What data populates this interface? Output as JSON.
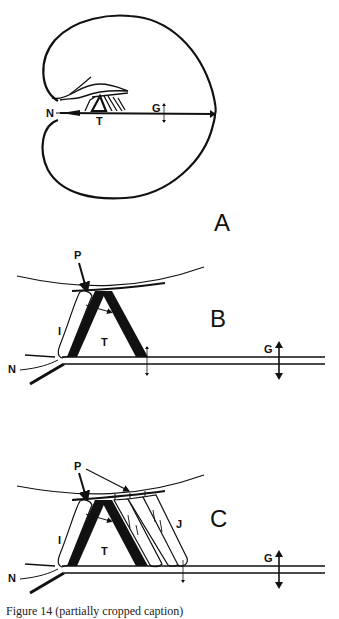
{
  "figure": {
    "panels": [
      {
        "id": "A",
        "label": "A",
        "annotations": {
          "N": "N",
          "T": "T",
          "G": "G"
        }
      },
      {
        "id": "B",
        "label": "B",
        "annotations": {
          "P": "P",
          "I": "I",
          "T": "T",
          "N": "N",
          "G": "G"
        }
      },
      {
        "id": "C",
        "label": "C",
        "annotations": {
          "P": "P",
          "I": "I",
          "T": "T",
          "J": "J",
          "N": "N",
          "G": "G"
        }
      }
    ],
    "caption": "Figure 14 (partially cropped caption)"
  },
  "colors": {
    "ink": "#111111",
    "background": "#ffffff"
  }
}
